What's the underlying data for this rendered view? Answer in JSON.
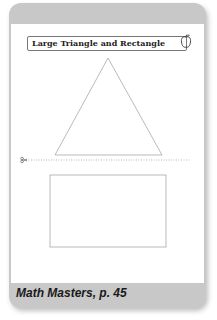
{
  "page": {
    "title": "Large Triangle and Rectangle",
    "footer": "Math Masters, p. 45",
    "icon": "apple-icon",
    "colors": {
      "frame": "#c8c8c8",
      "sheet": "#ffffff",
      "line": "#aaaaaa",
      "text": "#222222"
    }
  },
  "shapes": [
    {
      "type": "triangle",
      "label": "large-triangle"
    },
    {
      "type": "cut-line",
      "icon": "scissors-icon"
    },
    {
      "type": "rectangle",
      "label": "rectangle"
    }
  ]
}
